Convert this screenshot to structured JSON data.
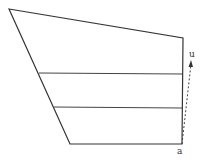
{
  "diagram": {
    "type": "quadrilateral-with-vector",
    "stroke_color": "#333333",
    "outline": [
      [
        9,
        9
      ],
      [
        183,
        38
      ],
      [
        182,
        144
      ],
      [
        70,
        144
      ]
    ],
    "horizontal_lines": [
      {
        "x1": 39,
        "x2": 182,
        "y": 73
      },
      {
        "x1": 54,
        "x2": 182,
        "y": 107
      }
    ],
    "vector": {
      "from": [
        182,
        144
      ],
      "to": [
        191,
        62
      ],
      "style": "dashed"
    },
    "labels": {
      "top_label": "u",
      "bottom_label": "a"
    }
  }
}
